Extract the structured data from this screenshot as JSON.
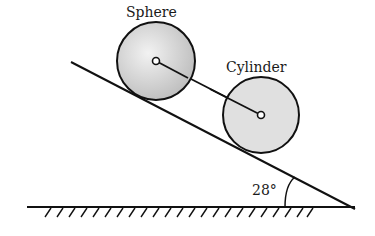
{
  "diagram": {
    "labels": {
      "sphere": "Sphere",
      "cylinder": "Cylinder",
      "angle": "28°"
    },
    "incline_angle_deg": 28,
    "colors": {
      "stroke": "#111111",
      "body_fill": "#d6d6d6"
    }
  }
}
